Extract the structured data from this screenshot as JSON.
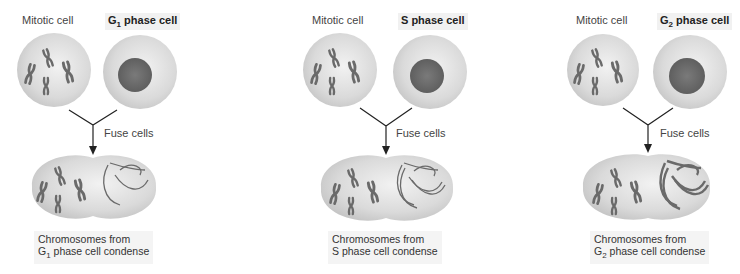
{
  "panels": [
    {
      "id": "g1",
      "left_label": "Mitotic cell",
      "right_label_main": "G",
      "right_label_sub": "1",
      "right_label_rest": " phase cell",
      "action": "Fuse cells",
      "caption_line1": "Chromosomes from",
      "caption_line2_main": "G",
      "caption_line2_sub": "1",
      "caption_line2_rest": " phase cell condense"
    },
    {
      "id": "s",
      "left_label": "Mitotic cell",
      "right_label_main": "S",
      "right_label_sub": "",
      "right_label_rest": " phase cell",
      "action": "Fuse cells",
      "caption_line1": "Chromosomes from",
      "caption_line2_main": "S",
      "caption_line2_sub": "",
      "caption_line2_rest": " phase cell condense"
    },
    {
      "id": "g2",
      "left_label": "Mitotic cell",
      "right_label_main": "G",
      "right_label_sub": "2",
      "right_label_rest": " phase cell",
      "action": "Fuse cells",
      "caption_line1": "Chromosomes from",
      "caption_line2_main": "G",
      "caption_line2_sub": "2",
      "caption_line2_rest": " phase cell condense"
    }
  ],
  "colors": {
    "cell_fill": "#dcdcdc",
    "nucleus_fill": "#6e6e6e",
    "chromosome": "#666666",
    "line": "#222222"
  }
}
